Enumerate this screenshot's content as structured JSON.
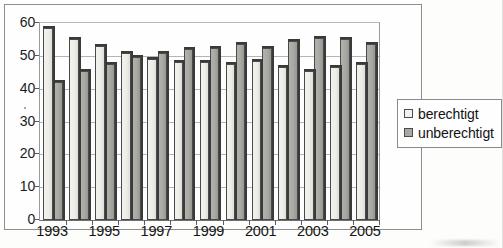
{
  "chart_data": {
    "type": "bar",
    "title": "",
    "subtitle": "",
    "xlabel": "",
    "ylabel": "",
    "ylim": [
      0,
      60
    ],
    "yticks": [
      0,
      10,
      20,
      30,
      40,
      50,
      60
    ],
    "grid": true,
    "legend_position": "right",
    "categories": [
      1993,
      1994,
      1995,
      1996,
      1997,
      1998,
      1999,
      2000,
      2001,
      2002,
      2003,
      2004,
      2005
    ],
    "xtick_labels": [
      "1993",
      "",
      "1995",
      "",
      "1997",
      "",
      "1999",
      "",
      "2001",
      "",
      "2003",
      "",
      "2005"
    ],
    "series": [
      {
        "name": "berechtigt",
        "color": "#f3f2ed",
        "values": [
          58.5,
          55.0,
          53.0,
          51.0,
          49.0,
          48.0,
          48.0,
          47.5,
          48.5,
          46.5,
          45.5,
          46.5,
          47.5
        ]
      },
      {
        "name": "unberechtigt",
        "color": "#a8a8a2",
        "values": [
          42.0,
          45.5,
          47.5,
          49.5,
          51.0,
          52.0,
          52.5,
          53.5,
          52.5,
          54.5,
          55.5,
          55.0,
          53.5
        ]
      }
    ],
    "annotations": []
  },
  "legend": {
    "entries": [
      {
        "label": "berechtigt",
        "swatch": "light-square-icon"
      },
      {
        "label": "unberechtigt",
        "swatch": "gray-square-icon"
      }
    ]
  }
}
